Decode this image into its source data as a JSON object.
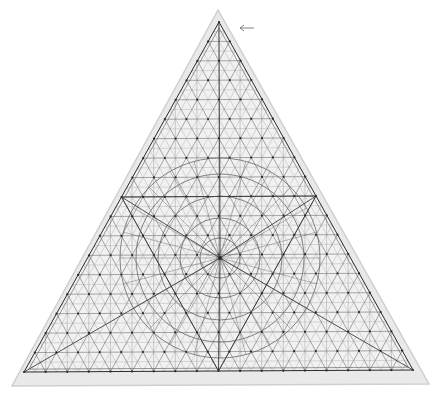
{
  "image": {
    "subject": "Triangular geometric construction drawing with a dense triangular grid, concentric circles and radial lines on aged paper",
    "width": 440,
    "height": 398
  },
  "colors": {
    "background": "#ffffff",
    "paper": "#e9e9e9",
    "paper_edge": "#cfcfcf",
    "ink": "#2a2a2a",
    "ink_light": "#555555"
  },
  "geometry": {
    "paper_triangle": [
      [
        218,
        10
      ],
      [
        12,
        386
      ],
      [
        429,
        384
      ]
    ],
    "inner_triangle": [
      [
        219,
        22
      ],
      [
        24,
        372
      ],
      [
        413,
        370
      ]
    ],
    "center": [
      220,
      258
    ],
    "grid_divisions": 18,
    "circle_radii": [
      20,
      40,
      62,
      84,
      100
    ],
    "arrow": {
      "from": [
        254,
        28
      ],
      "to": [
        240,
        28
      ]
    }
  }
}
